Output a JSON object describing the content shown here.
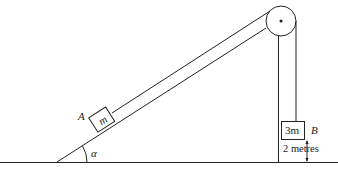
{
  "diagram": {
    "block_a": {
      "label": "A",
      "mass": "m"
    },
    "block_b": {
      "label": "B",
      "mass": "3m"
    },
    "angle": "α",
    "height_label": "2 metres"
  }
}
